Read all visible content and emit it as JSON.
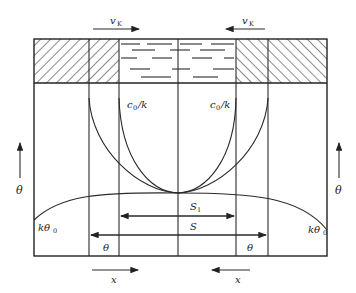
{
  "figure": {
    "type": "zone-melting schematic",
    "colors": {
      "line": "#2a2a2a",
      "background": "#ffffff"
    }
  },
  "labels": {
    "velocity_left": {
      "main": "v",
      "sub": "K"
    },
    "velocity_right": {
      "main": "v",
      "sub": "K"
    },
    "conc_left": "c",
    "conc_left_sub": "0",
    "conc_left_tail": "/k",
    "conc_right": "c",
    "conc_right_sub": "0",
    "conc_right_tail": "/k",
    "theta_axis_left": "θ",
    "theta_axis_right": "θ",
    "k_theta_left": "kθ",
    "k_theta_left_sub": "0",
    "k_theta_right": "kθ",
    "k_theta_right_sub": "0",
    "s1": "S",
    "s1_sub": "1",
    "s": "S",
    "theta_zone_left": "θ",
    "theta_zone_right": "θ",
    "x_left": "x",
    "x_right": "x"
  },
  "regions": {
    "top_band": [
      "hatched-solid-left",
      "hatched-solid-left-inner",
      "liquid-zone",
      "hatched-solid-right-inner",
      "hatched-solid-right"
    ]
  }
}
